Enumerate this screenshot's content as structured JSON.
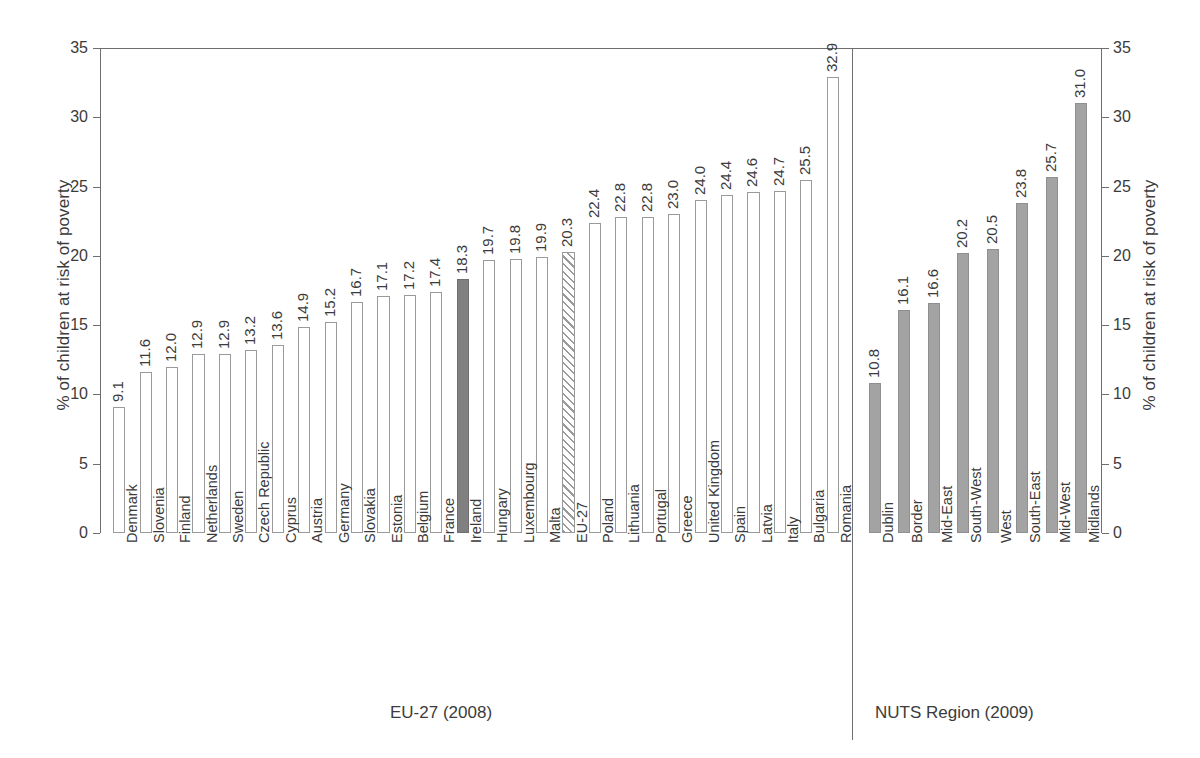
{
  "chart_data": {
    "type": "bar",
    "title": "",
    "xlabel": "",
    "ylabel": "% of children at risk of poverty",
    "ylabel_right": "% of children at risk of poverty",
    "ylim": [
      0,
      35
    ],
    "yticks": [
      0,
      5,
      10,
      15,
      20,
      25,
      30,
      35
    ],
    "ytick_labels": [
      "0",
      "5",
      "10",
      "15",
      "20",
      "25",
      "30",
      "35"
    ],
    "grid": false,
    "legend": "none",
    "categories": [
      "Denmark",
      "Slovenia",
      "Finland",
      "Netherlands",
      "Sweden",
      "Czech Republic",
      "Cyprus",
      "Austria",
      "Germany",
      "Slovakia",
      "Estonia",
      "Belgium",
      "France",
      "Ireland",
      "Hungary",
      "Luxembourg",
      "Malta",
      "EU-27",
      "Poland",
      "Lithuania",
      "Portugal",
      "Greece",
      "United Kingdom",
      "Spain",
      "Latvia",
      "Italy",
      "Bulgaria",
      "Romania",
      "Dublin",
      "Border",
      "Mid-East",
      "South-West",
      "West",
      "South-East",
      "Mid-West",
      "Midlands"
    ],
    "values": [
      9.1,
      11.6,
      12.0,
      12.9,
      12.9,
      13.2,
      13.6,
      14.9,
      15.2,
      16.7,
      17.1,
      17.2,
      17.4,
      18.3,
      19.7,
      19.8,
      19.9,
      20.3,
      22.4,
      22.8,
      22.8,
      23.0,
      24.0,
      24.4,
      24.6,
      24.7,
      25.5,
      32.9,
      10.8,
      16.1,
      16.6,
      20.2,
      20.5,
      23.8,
      25.7,
      31.0
    ],
    "value_labels": [
      "9.1",
      "11.6",
      "12.0",
      "12.9",
      "12.9",
      "13.2",
      "13.6",
      "14.9",
      "15.2",
      "16.7",
      "17.1",
      "17.2",
      "17.4",
      "18.3",
      "19.7",
      "19.8",
      "19.9",
      "20.3",
      "22.4",
      "22.8",
      "22.8",
      "23.0",
      "24.0",
      "24.4",
      "24.6",
      "24.7",
      "25.5",
      "32.9",
      "10.8",
      "16.1",
      "16.6",
      "20.2",
      "20.5",
      "23.8",
      "25.7",
      "31.0"
    ],
    "bar_styles": [
      "open",
      "open",
      "open",
      "open",
      "open",
      "open",
      "open",
      "open",
      "open",
      "open",
      "open",
      "open",
      "open",
      "solid-dark",
      "open",
      "open",
      "open",
      "hatched",
      "open",
      "open",
      "open",
      "open",
      "open",
      "open",
      "open",
      "open",
      "open",
      "open",
      "solid-mid",
      "solid-mid",
      "solid-mid",
      "solid-mid",
      "solid-mid",
      "solid-mid",
      "solid-mid",
      "solid-mid"
    ],
    "groups": [
      {
        "label": "EU-27 (2008)",
        "start": 0,
        "end": 27
      },
      {
        "label": "NUTS Region (2009)",
        "start": 28,
        "end": 35
      }
    ],
    "colors": {
      "open_fill": "#ffffff",
      "open_edge": "#9a9a9a",
      "highlight_fill": "#808080",
      "average_hatch": "#9a9a9a",
      "region_fill": "#a3a3a3",
      "axis": "#6e6e6e",
      "text": "#3b3b3b"
    }
  }
}
